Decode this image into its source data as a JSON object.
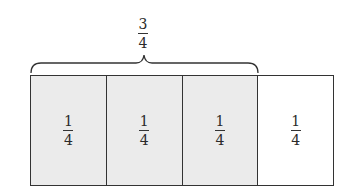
{
  "diagram": {
    "title_fraction": {
      "numerator": "3",
      "denominator": "4"
    },
    "brace": {
      "spans_cells": 3,
      "label": "3/4"
    },
    "strip": {
      "cells": [
        {
          "numerator": "1",
          "denominator": "4",
          "shaded": true
        },
        {
          "numerator": "1",
          "denominator": "4",
          "shaded": true
        },
        {
          "numerator": "1",
          "denominator": "4",
          "shaded": true
        },
        {
          "numerator": "1",
          "denominator": "4",
          "shaded": false
        }
      ]
    },
    "colors": {
      "shaded": "#ebebeb",
      "unshaded": "#ffffff",
      "line": "#333333"
    }
  }
}
